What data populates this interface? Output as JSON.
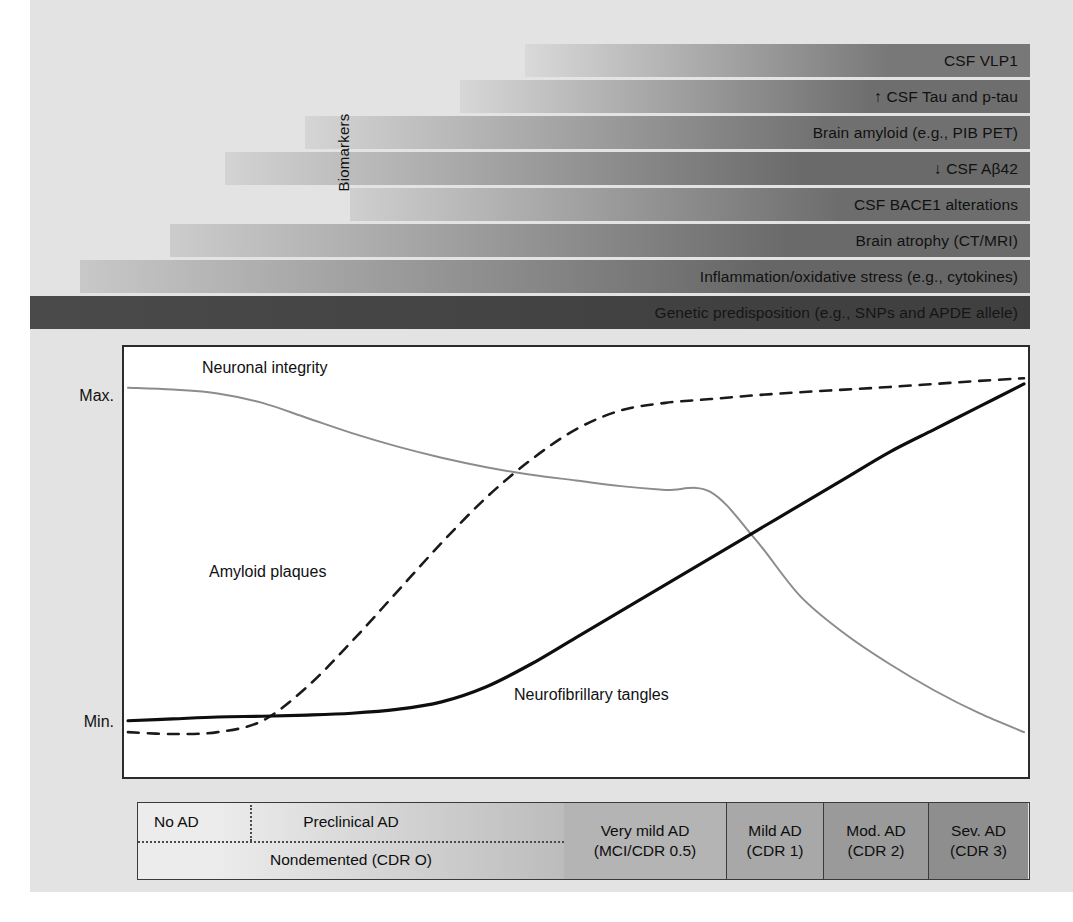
{
  "figure": {
    "background_color": "#e3e3e3",
    "panel_color": "#ffffff"
  },
  "biomarkers": {
    "axis_label": "Biomarkers",
    "rows": [
      {
        "label": "CSF VLP1",
        "start_pct": 49.5,
        "light_color": "#d9d9d9",
        "dark_color": "#787878",
        "label_color": "#111111"
      },
      {
        "label": "↑ CSF Tau and p-tau",
        "start_pct": 43.0,
        "light_color": "#d7d7d7",
        "dark_color": "#6e6e6e",
        "label_color": "#111111"
      },
      {
        "label": "Brain amyloid (e.g., PIB PET)",
        "start_pct": 27.5,
        "light_color": "#d5d5d5",
        "dark_color": "#707070",
        "label_color": "#111111"
      },
      {
        "label": "↓ CSF Aβ42",
        "start_pct": 19.5,
        "light_color": "#d3d3d3",
        "dark_color": "#6a6a6a",
        "label_color": "#111111"
      },
      {
        "label": "CSF BACE1 alterations",
        "start_pct": 32.0,
        "light_color": "#cfcfcf",
        "dark_color": "#6d6d6d",
        "label_color": "#111111"
      },
      {
        "label": "Brain atrophy (CT/MRI)",
        "start_pct": 14.0,
        "light_color": "#cccccc",
        "dark_color": "#6a6a6a",
        "label_color": "#111111"
      },
      {
        "label": "Inflammation/oxidative stress (e.g., cytokines)",
        "start_pct": 5.0,
        "light_color": "#c8c8c8",
        "dark_color": "#666666",
        "label_color": "#111111"
      },
      {
        "label": "Genetic predisposition (e.g., SNPs and APDE allele)",
        "start_pct": 0.0,
        "light_color": "#4a4a4a",
        "dark_color": "#404040",
        "label_color": "#151515"
      }
    ]
  },
  "chart_data": {
    "type": "line",
    "title": "",
    "xlabel": "",
    "ylabel": "",
    "ylim": [
      0,
      100
    ],
    "y_tick_labels": [
      "Max.",
      "Min."
    ],
    "grid": false,
    "legend": "inline-curve-labels",
    "x": [
      0,
      5,
      10,
      15,
      20,
      25,
      30,
      35,
      40,
      45,
      50,
      55,
      60,
      65,
      70,
      75,
      80,
      85,
      90,
      95,
      100
    ],
    "series": [
      {
        "name": "Neuronal integrity",
        "style": "solid-gray",
        "color": "#8c8c8c",
        "width": 2.0,
        "values": [
          95,
          94.5,
          93.5,
          91,
          87,
          83,
          79.5,
          76.5,
          74,
          72,
          70.5,
          69,
          68,
          67.5,
          55,
          40,
          30,
          22,
          15,
          9,
          4
        ]
      },
      {
        "name": "Amyloid plaques",
        "style": "dashed-black",
        "color": "#1a1a1a",
        "width": 2.6,
        "values": [
          4,
          3.5,
          4,
          7,
          16,
          28,
          41,
          54,
          66,
          76,
          84,
          89,
          91,
          92,
          93,
          93.8,
          94.5,
          95.2,
          96,
          96.8,
          97.5
        ]
      },
      {
        "name": "Neurofibrillary tangles",
        "style": "solid-black",
        "color": "#0e0e0e",
        "width": 3.2,
        "values": [
          7,
          7.5,
          8,
          8.2,
          8.5,
          9,
          10,
          12,
          16,
          22,
          29,
          36,
          43,
          50,
          57,
          64,
          71,
          78,
          84,
          90,
          96
        ]
      }
    ],
    "annotations": [
      {
        "text": "Neuronal integrity",
        "x_pct": 9,
        "y_pct": 4
      },
      {
        "text": "Amyloid plaques",
        "x_pct": 10,
        "y_pct": 50
      },
      {
        "text": "Neurofibrillary tangles",
        "x_pct": 43,
        "y_pct": 78
      }
    ]
  },
  "stages": {
    "left_top_labels": {
      "no_ad": "No AD",
      "preclinical_ad": "Preclinical AD"
    },
    "left_bottom_label": "Nondemented (CDR O)",
    "segments": [
      {
        "line1": "Very mild AD",
        "line2": "(MCI/CDR 0.5)",
        "width_px": 162,
        "color": "#b4b4b4"
      },
      {
        "line1": "Mild AD",
        "line2": "(CDR 1)",
        "width_px": 97,
        "color": "#a8a8a8"
      },
      {
        "line1": "Mod. AD",
        "line2": "(CDR 2)",
        "width_px": 105,
        "color": "#9a9a9a"
      },
      {
        "line1": "Sev. AD",
        "line2": "(CDR 3)",
        "width_px": 100,
        "color": "#8e8e8e"
      }
    ],
    "left_region": {
      "width_px": 426,
      "light_color": "#ececec",
      "dark_color": "#bcbcbc",
      "divider_x_px": 112
    }
  }
}
